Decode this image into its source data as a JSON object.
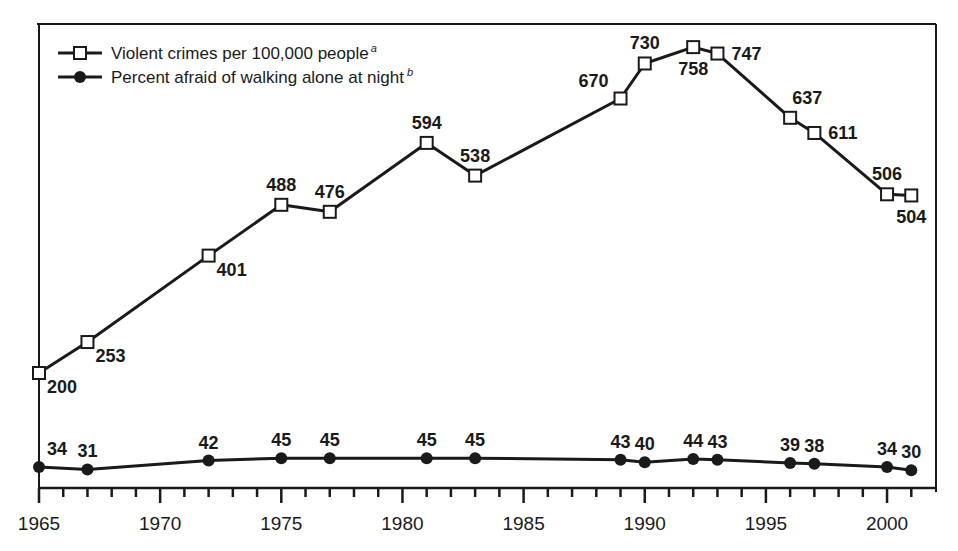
{
  "legend": {
    "items": [
      {
        "label": "Violent crimes per 100,000 people",
        "superscript": "a",
        "marker": "open-square"
      },
      {
        "label": "Percent afraid of walking alone at night",
        "superscript": "b",
        "marker": "filled-circle"
      }
    ]
  },
  "colors": {
    "line": "#1a1a1a",
    "background": "#ffffff"
  },
  "chart_data": {
    "type": "line",
    "title": "",
    "xlabel": "",
    "ylabel": "",
    "x_ticks": [
      1965,
      1970,
      1975,
      1980,
      1985,
      1990,
      1995,
      2000
    ],
    "xlim": [
      1965,
      2002
    ],
    "grid": false,
    "legend_position": "top-left",
    "series": [
      {
        "name": "Violent crimes per 100,000 people",
        "marker": "open-square",
        "points": [
          {
            "x": 1965,
            "y": 200,
            "label_pos": "below-right"
          },
          {
            "x": 1967,
            "y": 253,
            "label_pos": "below-right"
          },
          {
            "x": 1972,
            "y": 401,
            "label_pos": "below-right"
          },
          {
            "x": 1975,
            "y": 488,
            "label_pos": "above"
          },
          {
            "x": 1977,
            "y": 476,
            "label_pos": "above"
          },
          {
            "x": 1981,
            "y": 594,
            "label_pos": "above"
          },
          {
            "x": 1983,
            "y": 538,
            "label_pos": "above"
          },
          {
            "x": 1989,
            "y": 670,
            "label_pos": "above-left"
          },
          {
            "x": 1990,
            "y": 730,
            "label_pos": "above"
          },
          {
            "x": 1992,
            "y": 758,
            "label_pos": "below"
          },
          {
            "x": 1993,
            "y": 747,
            "label_pos": "right"
          },
          {
            "x": 1996,
            "y": 637,
            "label_pos": "above-right"
          },
          {
            "x": 1997,
            "y": 611,
            "label_pos": "right"
          },
          {
            "x": 2000,
            "y": 506,
            "label_pos": "above"
          },
          {
            "x": 2001,
            "y": 504,
            "label_pos": "below"
          }
        ]
      },
      {
        "name": "Percent afraid of walking alone at night",
        "marker": "filled-circle",
        "points": [
          {
            "x": 1965,
            "y": 34
          },
          {
            "x": 1967,
            "y": 31
          },
          {
            "x": 1972,
            "y": 42
          },
          {
            "x": 1975,
            "y": 45
          },
          {
            "x": 1977,
            "y": 45
          },
          {
            "x": 1981,
            "y": 45
          },
          {
            "x": 1983,
            "y": 45
          },
          {
            "x": 1989,
            "y": 43
          },
          {
            "x": 1990,
            "y": 40
          },
          {
            "x": 1992,
            "y": 44
          },
          {
            "x": 1993,
            "y": 43
          },
          {
            "x": 1996,
            "y": 39
          },
          {
            "x": 1997,
            "y": 38
          },
          {
            "x": 2000,
            "y": 34
          },
          {
            "x": 2001,
            "y": 30
          }
        ]
      }
    ]
  }
}
